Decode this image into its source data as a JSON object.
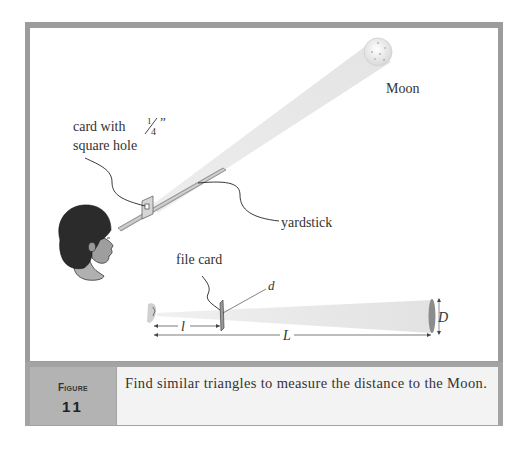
{
  "figure": {
    "label_word": "Figure",
    "number": "11",
    "caption": "Find similar triangles to measure the distance to the Moon."
  },
  "diagram": {
    "labels": {
      "moon": "Moon",
      "card": "card with",
      "fraction_num": "1",
      "fraction_den": "4",
      "inch_mark": "”",
      "square_hole": "square hole",
      "yardstick": "yardstick",
      "file_card": "file card",
      "d": "d",
      "l": "l",
      "L": "L",
      "D": "D"
    },
    "colors": {
      "frame": "#9c9c9c",
      "beam": "#e6e6e6",
      "hair": "#2a2a2a",
      "skin": "#a8a8a8"
    }
  }
}
